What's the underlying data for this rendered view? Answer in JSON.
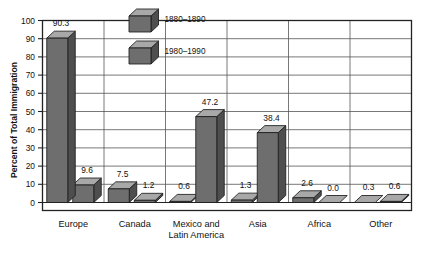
{
  "chart_data": {
    "type": "bar",
    "title": "",
    "xlabel": "",
    "ylabel": "Percent of Total Immigration",
    "ylim": [
      0,
      100
    ],
    "yticks": [
      "0",
      "10",
      "20",
      "30",
      "40",
      "50",
      "60",
      "70",
      "80",
      "90",
      "100"
    ],
    "grid": true,
    "legend_position": "inside-top-left",
    "categories": [
      "Europe",
      "Canada",
      "Mexico and Latin America",
      "Asia",
      "Africa",
      "Other"
    ],
    "category_lines": [
      [
        "Europe"
      ],
      [
        "Canada"
      ],
      [
        "Mexico and",
        "Latin America"
      ],
      [
        "Asia"
      ],
      [
        "Africa"
      ],
      [
        "Other"
      ]
    ],
    "series": [
      {
        "name": "1880–1890",
        "values": [
          90.3,
          7.5,
          0.6,
          1.3,
          2.6,
          0.3
        ],
        "labels": [
          "90.3",
          "7.5",
          "0.6",
          "1.3",
          "2.6",
          "0.3"
        ]
      },
      {
        "name": "1980–1990",
        "values": [
          9.6,
          1.2,
          47.2,
          38.4,
          0.0,
          0.6
        ],
        "labels": [
          "9.6",
          "1.2",
          "47.2",
          "38.4",
          "0.0",
          "0.6"
        ]
      }
    ]
  },
  "legend": {
    "items": [
      {
        "label": "1880–1890"
      },
      {
        "label": "1980–1990"
      }
    ]
  },
  "colors": {
    "bar_front": "#6e6e6e",
    "bar_top": "#a8a8a8",
    "bar_side": "#4e4e4e",
    "bar_outline": "#1c1c1c",
    "grid": "#555555",
    "frame": "#222222",
    "background": "#ffffff",
    "text": "#111111"
  }
}
